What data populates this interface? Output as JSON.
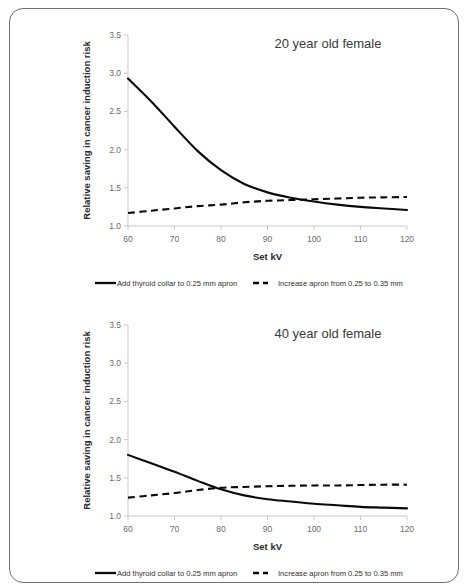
{
  "figure": {
    "frame_color": "#6f6f78",
    "background": "#ffffff",
    "series_color": "#0a0a0a",
    "axis_color": "#c9c9c9"
  },
  "chart_data": [
    {
      "type": "line",
      "title": "20 year old female",
      "xlabel": "Set kV",
      "ylabel": "Relative saving in cancer induction risk",
      "xlim": [
        60,
        120
      ],
      "ylim": [
        1.0,
        3.5
      ],
      "xticks": [
        60,
        70,
        80,
        90,
        100,
        110,
        120
      ],
      "xtick_labels": [
        "60",
        "70",
        "80",
        "90",
        "100",
        "110",
        "120"
      ],
      "yticks": [
        1.0,
        1.5,
        2.0,
        2.5,
        3.0,
        3.5
      ],
      "ytick_labels": [
        "1.0",
        "1.5",
        "2.0",
        "2.5",
        "3.0",
        "3.5"
      ],
      "grid": false,
      "legend_position": "below",
      "x": [
        60,
        65,
        70,
        75,
        80,
        85,
        90,
        95,
        100,
        105,
        110,
        115,
        120
      ],
      "series": [
        {
          "name": "Add thyroid collar to 0.25 mm apron",
          "style": "solid",
          "values": [
            2.93,
            2.63,
            2.3,
            1.98,
            1.73,
            1.55,
            1.44,
            1.37,
            1.32,
            1.28,
            1.25,
            1.23,
            1.21
          ]
        },
        {
          "name": "Increase apron from 0.25 to 0.35 mm",
          "style": "dashed",
          "values": [
            1.17,
            1.2,
            1.23,
            1.26,
            1.28,
            1.31,
            1.33,
            1.34,
            1.35,
            1.36,
            1.37,
            1.375,
            1.38
          ]
        }
      ]
    },
    {
      "type": "line",
      "title": "40 year old female",
      "xlabel": "Set kV",
      "ylabel": "Relative saving in cancer induction risk",
      "xlim": [
        60,
        120
      ],
      "ylim": [
        1.0,
        3.5
      ],
      "xticks": [
        60,
        70,
        80,
        90,
        100,
        110,
        120
      ],
      "xtick_labels": [
        "60",
        "70",
        "80",
        "90",
        "100",
        "110",
        "120"
      ],
      "yticks": [
        1.0,
        1.5,
        2.0,
        2.5,
        3.0,
        3.5
      ],
      "ytick_labels": [
        "1.0",
        "1.5",
        "2.0",
        "2.5",
        "3.0",
        "3.5"
      ],
      "grid": false,
      "legend_position": "below",
      "x": [
        60,
        65,
        70,
        75,
        80,
        85,
        90,
        95,
        100,
        105,
        110,
        115,
        120
      ],
      "series": [
        {
          "name": "Add thyroid collar to 0.25 mm apron",
          "style": "solid",
          "values": [
            1.8,
            1.69,
            1.58,
            1.46,
            1.35,
            1.27,
            1.22,
            1.19,
            1.16,
            1.14,
            1.12,
            1.11,
            1.1
          ]
        },
        {
          "name": "Increase apron from 0.25 to 0.35 mm",
          "style": "dashed",
          "values": [
            1.24,
            1.27,
            1.3,
            1.34,
            1.37,
            1.38,
            1.39,
            1.395,
            1.4,
            1.4,
            1.405,
            1.41,
            1.41
          ]
        }
      ]
    }
  ],
  "legend": {
    "entries": [
      {
        "label": "Add thyroid collar to 0.25 mm apron",
        "style": "solid"
      },
      {
        "label": "Increase apron from 0.25 to 0.35 mm",
        "style": "dashed"
      }
    ]
  }
}
